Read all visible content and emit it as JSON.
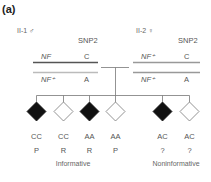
{
  "panel_label": "(a)",
  "parents": [
    {
      "id": "II-1",
      "sex_symbol": "♂",
      "label": "II-1 ♂",
      "marker_header": "SNP2",
      "haplotypes": [
        {
          "gene": "NF",
          "snp": "C",
          "line_color": "#555555"
        },
        {
          "gene": "NF⁺",
          "snp": "A",
          "line_color": "#bbbbbb"
        }
      ]
    },
    {
      "id": "II-2",
      "sex_symbol": "♀",
      "label": "II-2 ♀",
      "marker_header": "SNP2",
      "haplotypes": [
        {
          "gene": "NF⁺",
          "snp": "C",
          "line_color": "#aaaaaa"
        },
        {
          "gene": "NF⁺",
          "snp": "A",
          "line_color": "#aaaaaa"
        }
      ]
    }
  ],
  "offspring": [
    {
      "affected": true,
      "genotype": "CC",
      "outcome": "P"
    },
    {
      "affected": false,
      "genotype": "CC",
      "outcome": "R"
    },
    {
      "affected": true,
      "genotype": "AA",
      "outcome": "R"
    },
    {
      "affected": false,
      "genotype": "AA",
      "outcome": "P"
    },
    {
      "affected": true,
      "genotype": "AC",
      "outcome": "?"
    },
    {
      "affected": false,
      "genotype": "AC",
      "outcome": "?"
    }
  ],
  "groups": [
    {
      "label": "Informative"
    },
    {
      "label": "Noninformative"
    }
  ],
  "colors": {
    "affected_fill": "#111111",
    "unaffected_fill": "#ffffff",
    "line": "#777777"
  }
}
